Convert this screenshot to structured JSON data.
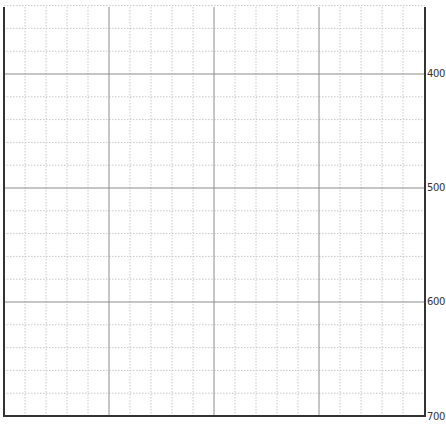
{
  "chart_data": {
    "type": "line",
    "title": "",
    "xlabel": "",
    "ylabel": "",
    "y_axis_position": "right",
    "y_axis_inverted": true,
    "ylim": [
      300,
      700
    ],
    "yticks": [
      400,
      500,
      600,
      700
    ],
    "ytick_labels": [
      "400",
      "500",
      "600",
      "700"
    ],
    "grid": {
      "major": true,
      "minor": true,
      "major_style": "solid",
      "minor_style": "dotted",
      "minor_per_major": 5
    },
    "series": [],
    "legend": null
  },
  "colors": {
    "axis": "#333333",
    "major_grid": "#8c8c8c",
    "minor_grid": "#c8c8c8",
    "background": "#ffffff"
  },
  "geometry": {
    "plot_left": 4,
    "plot_right": 425,
    "plot_top": 7,
    "plot_bottom": 416,
    "x_major_step": 105,
    "x_minor_step": 21,
    "y_major_pixels": {
      "400": 74,
      "500": 188,
      "600": 302,
      "700": 416
    },
    "y_minor_step": 22.8
  }
}
